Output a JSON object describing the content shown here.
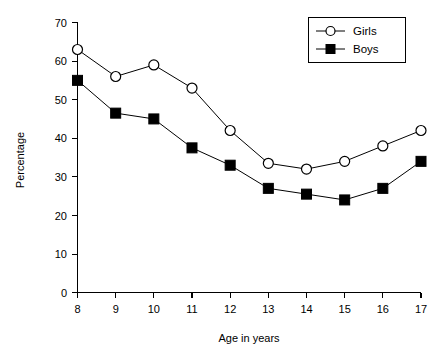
{
  "chart_data": {
    "type": "line",
    "title": "",
    "subtitle": "",
    "xlabel": "Age in years",
    "ylabel": "Percentage",
    "categories": [
      8,
      9,
      10,
      11,
      12,
      13,
      14,
      15,
      16,
      17
    ],
    "x": [
      8,
      9,
      10,
      11,
      12,
      13,
      14,
      15,
      16,
      17
    ],
    "xlim": [
      8,
      17
    ],
    "ylim": [
      0,
      70
    ],
    "xticks": [
      "8",
      "9",
      "10",
      "11",
      "12",
      "13",
      "14",
      "15",
      "16",
      "17"
    ],
    "yticks": [
      "0",
      "10",
      "20",
      "30",
      "40",
      "50",
      "60",
      "70"
    ],
    "grid": false,
    "legend_position": "top-right",
    "series": [
      {
        "name": "Girls",
        "marker": "open-circle",
        "color": "#000000",
        "values": [
          63,
          56,
          59,
          53,
          42,
          33.5,
          32,
          34,
          38,
          42
        ]
      },
      {
        "name": "Boys",
        "marker": "filled-square",
        "color": "#000000",
        "values": [
          55,
          46.5,
          45,
          37.5,
          33,
          27,
          25.5,
          24,
          27,
          34
        ]
      }
    ]
  },
  "axes": {
    "y_title": "Percentage",
    "x_title": "Age in years",
    "y_tick_labels": [
      "70",
      "60",
      "50",
      "40",
      "30",
      "20",
      "10",
      "0"
    ],
    "x_tick_labels": [
      "8",
      "9",
      "10",
      "11",
      "12",
      "13",
      "14",
      "15",
      "16",
      "17"
    ]
  },
  "legend": {
    "items": [
      {
        "label": "Girls",
        "marker": "open-circle"
      },
      {
        "label": "Boys",
        "marker": "filled-square"
      }
    ]
  }
}
